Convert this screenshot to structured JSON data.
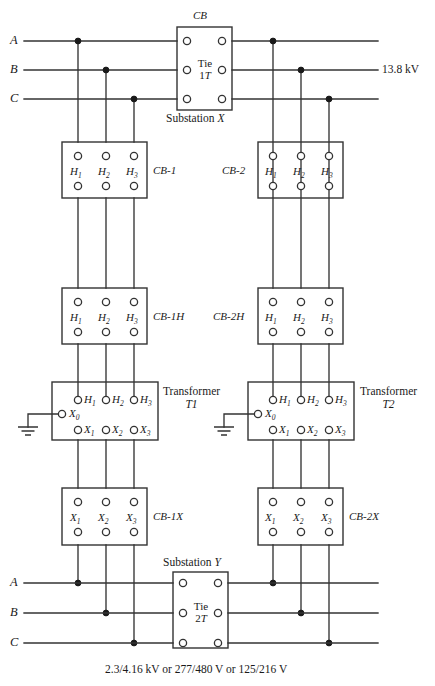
{
  "figure": {
    "type": "electrical-one-line-diagram",
    "title_top": "CB",
    "substation_top": {
      "prefix": "Substation",
      "name": "X"
    },
    "substation_bottom": {
      "prefix": "Substation",
      "name": "Y"
    },
    "voltage_top_right": "13.8 kV",
    "caption_bottom": "2.3/4.16 kV or 277/480 V or 125/216 V"
  },
  "phases": {
    "top": [
      "A",
      "B",
      "C"
    ],
    "bottom": [
      "A",
      "B",
      "C"
    ]
  },
  "ties": [
    {
      "id": "tie-1t",
      "line1": "Tie",
      "line2": "1",
      "line2_ital": "T"
    },
    {
      "id": "tie-2t",
      "line1": "Tie",
      "line2": "2",
      "line2_ital": "T"
    }
  ],
  "terminals": {
    "h": [
      "H",
      "H",
      "H"
    ],
    "h_subs": [
      "1",
      "2",
      "3"
    ],
    "x": [
      "X",
      "X",
      "X"
    ],
    "x_subs": [
      "1",
      "2",
      "3"
    ],
    "neutral": {
      "letter": "X",
      "sub": "0"
    }
  },
  "devices": [
    {
      "id": "cb-1",
      "label": "CB-1",
      "side": "left",
      "terminal_set": "H"
    },
    {
      "id": "cb-2",
      "label": "CB-2",
      "side": "right",
      "terminal_set": "H"
    },
    {
      "id": "cb-1h",
      "label": "CB-1H",
      "side": "left",
      "terminal_set": "H"
    },
    {
      "id": "cb-2h",
      "label": "CB-2H",
      "side": "right",
      "terminal_set": "H"
    },
    {
      "id": "cb-1x",
      "label": "CB-1X",
      "side": "left",
      "terminal_set": "X"
    },
    {
      "id": "cb-2x",
      "label": "CB-2X",
      "side": "right",
      "terminal_set": "X"
    }
  ],
  "transformers": [
    {
      "id": "t1",
      "word": "Transformer",
      "name": "T1"
    },
    {
      "id": "t2",
      "word": "Transformer",
      "name": "T2"
    }
  ],
  "colors": {
    "line": "#333333",
    "text": "#1a1a1a",
    "background": "#ffffff"
  }
}
